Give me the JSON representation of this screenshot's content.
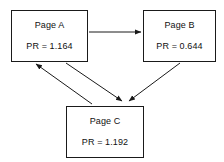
{
  "diagram": {
    "background_color": "#ffffff",
    "line_color": "#1a1a1a",
    "nodes": [
      {
        "id": "page-a",
        "title": "Page A",
        "metric": "PR = 1.164",
        "metric_label": "PR",
        "metric_value": 1.164
      },
      {
        "id": "page-b",
        "title": "Page B",
        "metric": "PR = 0.644",
        "metric_label": "PR",
        "metric_value": 0.644
      },
      {
        "id": "page-c",
        "title": "Page C",
        "metric": "PR = 1.192",
        "metric_label": "PR",
        "metric_value": 1.192
      }
    ],
    "edges": [
      {
        "id": "edge-a-to-b",
        "from": "page-a",
        "to": "page-b",
        "style": "straight-horizontal"
      },
      {
        "id": "edge-a-to-c",
        "from": "page-a",
        "to": "page-c",
        "style": "diagonal"
      },
      {
        "id": "edge-b-to-c",
        "from": "page-b",
        "to": "page-c",
        "style": "diagonal"
      },
      {
        "id": "edge-c-to-a",
        "from": "page-c",
        "to": "page-a",
        "style": "diagonal"
      }
    ]
  }
}
